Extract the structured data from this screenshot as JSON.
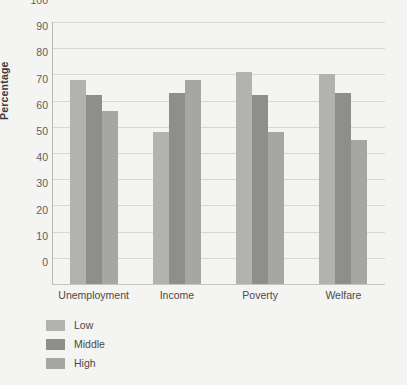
{
  "chart_data": {
    "type": "bar",
    "title": "",
    "xlabel": "",
    "ylabel": "Percentage",
    "ylim": [
      0,
      100
    ],
    "ytick_step": 10,
    "yticks": [
      0,
      10,
      20,
      30,
      40,
      50,
      60,
      70,
      80,
      90,
      100
    ],
    "grid": "horizontal",
    "legend_position": "bottom-left",
    "categories": [
      "Unemployment",
      "Income",
      "Poverty",
      "Welfare"
    ],
    "series": [
      {
        "name": "Low",
        "color": "#b2b2b0",
        "values": [
          78,
          58,
          81,
          80
        ]
      },
      {
        "name": "Middle",
        "color": "#8e8e8c",
        "values": [
          72,
          73,
          72,
          73
        ]
      },
      {
        "name": "High",
        "color": "#a6a6a4",
        "values": [
          66,
          78,
          58,
          55
        ]
      }
    ]
  },
  "colors": {
    "background": "#f4f4f2",
    "gridline": "#d7d7d5",
    "axis": "#b9b9b7",
    "text": "#4a4a48"
  }
}
